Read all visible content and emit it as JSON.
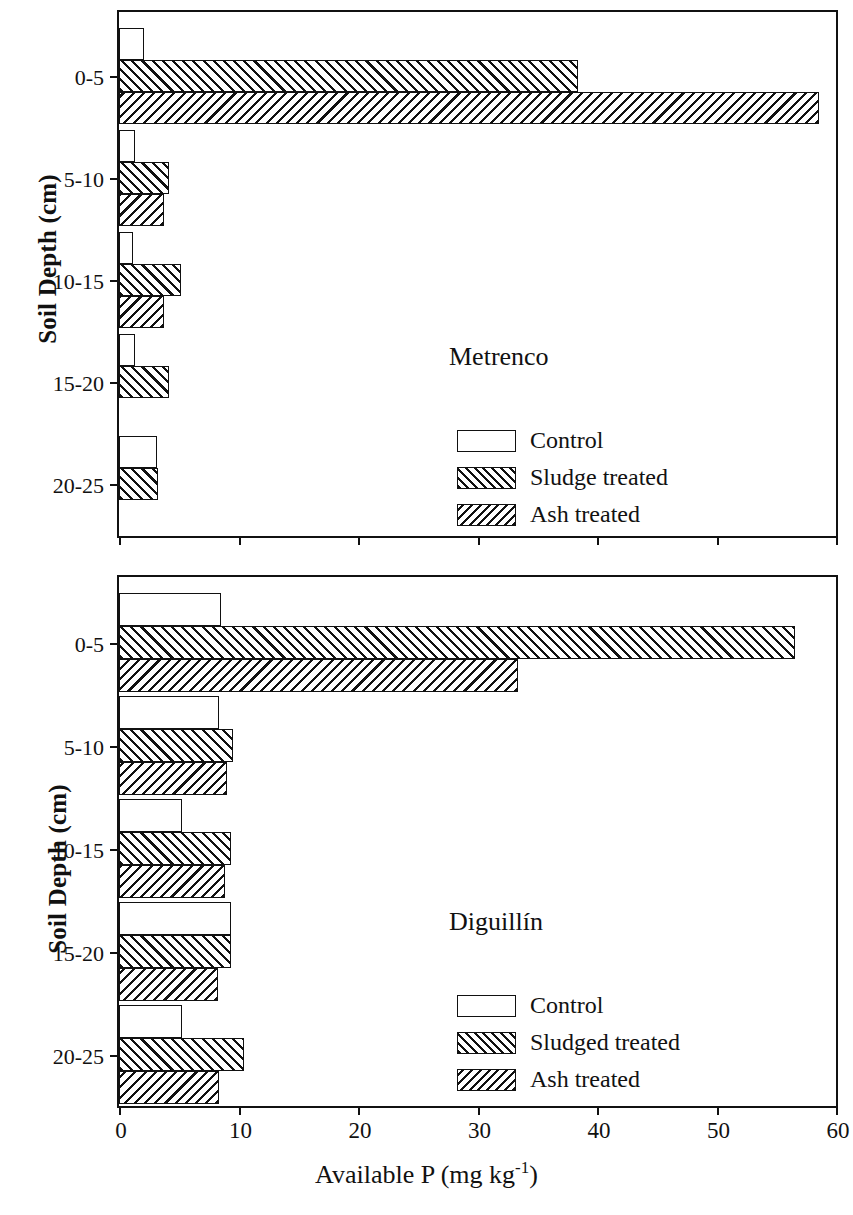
{
  "chart_data": {
    "type": "bar",
    "orientation": "horizontal",
    "title": "",
    "xlabel": "Available P (mg kg-1)",
    "xlabel_parts": {
      "main": "Available P (mg kg",
      "exponent": "-1",
      "tail": ")"
    },
    "ylabel": "Soil Depth (cm)",
    "xlim": [
      0,
      60
    ],
    "xticks": [
      0,
      10,
      20,
      30,
      40,
      50,
      60
    ],
    "xtick_labels": [
      "0",
      "10",
      "20",
      "30",
      "40",
      "50",
      "60"
    ],
    "categories": [
      "0-5",
      "5-10",
      "10-15",
      "15-20",
      "20-25"
    ],
    "grid": false,
    "legend_position": "inside lower-right",
    "panels": [
      {
        "name": "Metrenco",
        "legend": [
          {
            "label": "Control",
            "pattern": "empty"
          },
          {
            "label": "Sludge treated",
            "pattern": "forward-hatch"
          },
          {
            "label": "Ash treated",
            "pattern": "back-hatch"
          }
        ],
        "series": [
          {
            "name": "Control",
            "values": [
              2.1,
              1.3,
              1.2,
              1.3,
              3.2
            ]
          },
          {
            "name": "Sludge treated",
            "values": [
              38.4,
              4.2,
              5.2,
              4.2,
              3.3
            ]
          },
          {
            "name": "Ash treated",
            "values": [
              58.6,
              3.8,
              3.8,
              0,
              0
            ]
          }
        ]
      },
      {
        "name": "Diguillín",
        "legend": [
          {
            "label": "Control",
            "pattern": "empty"
          },
          {
            "label": "Sludged treated",
            "pattern": "forward-hatch"
          },
          {
            "label": "Ash treated",
            "pattern": "back-hatch"
          }
        ],
        "series": [
          {
            "name": "Control",
            "values": [
              8.5,
              8.4,
              5.3,
              9.4,
              5.3
            ]
          },
          {
            "name": "Sludged treated",
            "values": [
              56.6,
              9.5,
              9.4,
              9.4,
              10.5
            ]
          },
          {
            "name": "Ash treated",
            "values": [
              33.4,
              9.0,
              8.9,
              8.3,
              8.4
            ]
          }
        ]
      }
    ]
  },
  "axes": {
    "ylabel": "Soil Depth (cm)",
    "xlabel_main": "Available P (mg kg",
    "xlabel_exp": "-1",
    "xlabel_tail": ")"
  }
}
